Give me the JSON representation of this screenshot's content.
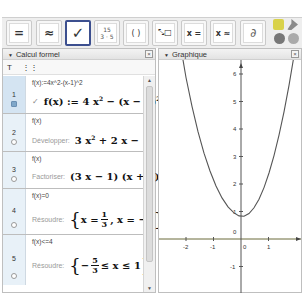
{
  "toolbar": {
    "buttons": [
      {
        "name": "evaluate",
        "label": "="
      },
      {
        "name": "numeric",
        "label": "≈"
      },
      {
        "name": "keep-input",
        "label": "✓",
        "selected": true
      },
      {
        "name": "factor-number",
        "top": "15",
        "bottom": "3 · 5"
      },
      {
        "name": "expand",
        "label": "( )"
      },
      {
        "name": "substitute",
        "label": "⤡□"
      },
      {
        "name": "solve",
        "label": "x ="
      },
      {
        "name": "solve-numerically",
        "label": "x ≈"
      },
      {
        "name": "derivative",
        "label": "∂"
      },
      {
        "name": "delete",
        "label": "⌫"
      }
    ]
  },
  "cas_panel": {
    "title": "Calcul formel",
    "close": "×",
    "tools": [
      "T",
      "⋮⋮"
    ],
    "rows": [
      {
        "num": "1",
        "input": "f(x):=4x^2-(x-1)^2",
        "label": "",
        "output": "f(x) := 4 x² − (x − 1)²",
        "active": true
      },
      {
        "num": "2",
        "input": "f(x)",
        "label": "Développer:",
        "output": "3 x² + 2 x − 1"
      },
      {
        "num": "3",
        "input": "f(x)",
        "label": "Factoriser:",
        "output": "(3 x − 1) (x + 1)"
      },
      {
        "num": "4",
        "input": "f(x)=0",
        "label": "Résoudre:",
        "output": "{x = 1/3 , x = −1}"
      },
      {
        "num": "5",
        "input": "f(x)<=4",
        "label": "Résoudre:",
        "output": "{−5/3 ≤ x ≤ 1}"
      }
    ]
  },
  "graph_panel": {
    "title": "Graphique",
    "close": "×",
    "x_ticks": [
      "-2",
      "-1",
      "0",
      "1"
    ],
    "y_ticks": [
      "6",
      "5",
      "4",
      "3",
      "2",
      "1",
      "-1"
    ],
    "origin_label": "0",
    "function": "f(x) = 4x^2 - (x-1)^2"
  },
  "colors": {
    "selected_border": "#3c4f8f",
    "row_num_bg": "#e8f1f8",
    "curve": "#555555",
    "x_axis": "#6b6b3a"
  }
}
